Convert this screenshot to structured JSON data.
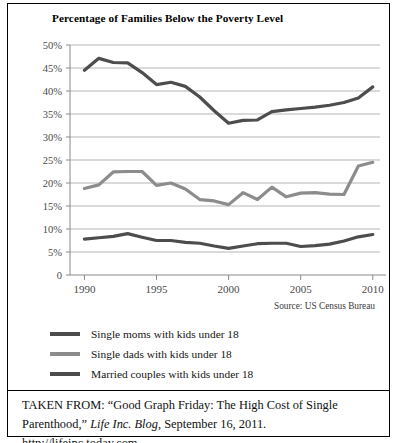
{
  "figure": {
    "title": "Percentage of  Families Below the Poverty Level",
    "source_note": "Source: US Census Bureau",
    "caption": {
      "prefix": "TAKEN FROM: “Good Graph Friday: The High Cost of Single Parenthood,” ",
      "italic_title": "Life Inc. Blog",
      "suffix": ", September 16, 2011. http://lifeinc.today.com."
    }
  },
  "colors": {
    "single_moms": "#4d4d4d",
    "single_dads": "#8c8c8c",
    "married_couples": "#4d4d4d",
    "gridline": "#b5b5b5",
    "axis": "#8a8a8a",
    "text": "#1a1a1a"
  },
  "legend": {
    "position": "below-plot",
    "items": [
      {
        "label": "Single moms with kids under 18",
        "color": "#4d4d4d"
      },
      {
        "label": "Single dads with kids under 18",
        "color": "#8c8c8c"
      },
      {
        "label": "Married couples with kids under 18",
        "color": "#4d4d4d"
      }
    ]
  },
  "chart_data": {
    "type": "line",
    "title": "Percentage of  Families Below the Poverty Level",
    "xlabel": "",
    "ylabel": "",
    "xlim": [
      1989,
      2010.5
    ],
    "ylim": [
      0,
      50
    ],
    "grid": true,
    "y_ticks": [
      0,
      5,
      10,
      15,
      20,
      25,
      30,
      35,
      40,
      45,
      50
    ],
    "y_tick_labels": [
      "0",
      "5%",
      "10%",
      "15%",
      "20%",
      "25%",
      "30%",
      "35%",
      "40%",
      "45%",
      "50%"
    ],
    "x_ticks": [
      1990,
      1995,
      2000,
      2005,
      2010
    ],
    "x_tick_labels": [
      "1990",
      "1995",
      "2000",
      "2005",
      "2010"
    ],
    "x": [
      1990,
      1991,
      1992,
      1993,
      1994,
      1995,
      1996,
      1997,
      1998,
      1999,
      2000,
      2001,
      2002,
      2003,
      2004,
      2005,
      2006,
      2007,
      2008,
      2009,
      2010
    ],
    "series": [
      {
        "name": "Single moms with kids under 18",
        "color": "#4d4d4d",
        "values": [
          44.5,
          47.1,
          46.2,
          46.1,
          44.0,
          41.4,
          41.9,
          41.0,
          38.7,
          35.7,
          33.0,
          33.6,
          33.7,
          35.5,
          35.9,
          36.2,
          36.5,
          36.9,
          37.5,
          38.5,
          40.9
        ]
      },
      {
        "name": "Single dads with kids under 18",
        "color": "#8c8c8c",
        "values": [
          18.8,
          19.6,
          22.4,
          22.5,
          22.5,
          19.5,
          20.0,
          18.7,
          16.4,
          16.1,
          15.3,
          17.9,
          16.4,
          19.1,
          17.0,
          17.8,
          17.9,
          17.6,
          17.5,
          23.7,
          24.5
        ]
      },
      {
        "name": "Married couples with kids under 18",
        "color": "#4d4d4d",
        "values": [
          7.8,
          8.1,
          8.4,
          9.0,
          8.2,
          7.5,
          7.5,
          7.1,
          6.9,
          6.3,
          5.8,
          6.3,
          6.8,
          6.9,
          6.9,
          6.2,
          6.4,
          6.7,
          7.4,
          8.3,
          8.8
        ]
      }
    ]
  }
}
